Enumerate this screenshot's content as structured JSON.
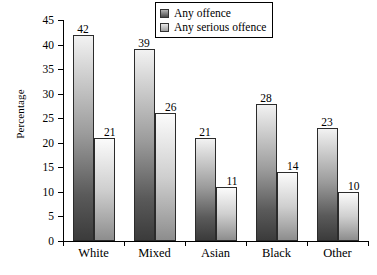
{
  "chart_data": {
    "type": "bar",
    "title": "",
    "subtitle": "",
    "xlabel": "",
    "ylabel": "Percentage",
    "categories": [
      "White",
      "Mixed",
      "Asian",
      "Black",
      "Other"
    ],
    "series": [
      {
        "name": "Any offence",
        "values": [
          42,
          39,
          21,
          28,
          23
        ],
        "color": "#4a4a4a"
      },
      {
        "name": "Any serious offence",
        "values": [
          21,
          26,
          11,
          14,
          10
        ],
        "color": "#b0b0b0"
      }
    ],
    "ylim": [
      0,
      45
    ],
    "ytick_values": [
      0,
      5,
      10,
      15,
      20,
      25,
      30,
      35,
      40,
      45
    ],
    "ytick_labels": [
      "0",
      "5",
      "10",
      "15",
      "20",
      "25",
      "30",
      "35",
      "40",
      "45"
    ],
    "grid": false,
    "legend_position": "top-right",
    "data_labels": true
  },
  "legend": {
    "items": [
      {
        "label": "Any offence",
        "swatch": "legend-swatch-dark"
      },
      {
        "label": "Any serious offence",
        "swatch": "legend-swatch-light"
      }
    ]
  }
}
